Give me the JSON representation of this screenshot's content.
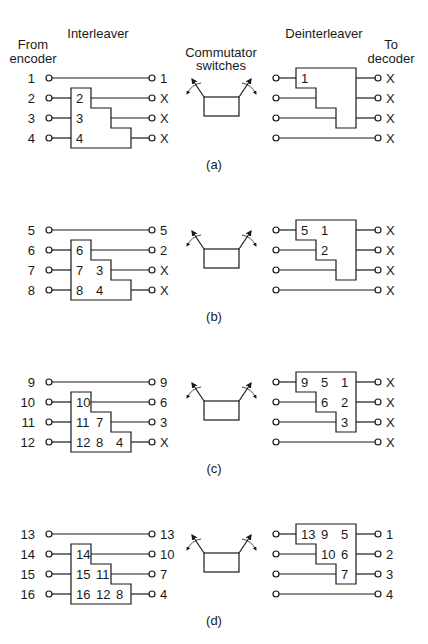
{
  "headers": {
    "from_encoder_line1": "From",
    "from_encoder_line2": "encoder",
    "interleaver": "Interleaver",
    "commutator_line1": "Commutator",
    "commutator_line2": "switches",
    "deinterleaver": "Deinterleaver",
    "to_decoder_line1": "To",
    "to_decoder_line2": "decoder"
  },
  "colors": {
    "line": "#1a1a1a",
    "background": "#ffffff"
  },
  "panels": [
    {
      "label": "(a)",
      "inputs": [
        "1",
        "2",
        "3",
        "4"
      ],
      "interleaver_cells": [
        [],
        [
          "2"
        ],
        [
          "3"
        ],
        [
          "4"
        ]
      ],
      "interleaver_outputs": [
        "1",
        "X",
        "X",
        "X"
      ],
      "deinterleaver_cells": [
        [
          "1"
        ],
        [],
        [],
        []
      ],
      "decoder_outputs": [
        "X",
        "X",
        "X",
        "X"
      ]
    },
    {
      "label": "(b)",
      "inputs": [
        "5",
        "6",
        "7",
        "8"
      ],
      "interleaver_cells": [
        [],
        [
          "6"
        ],
        [
          "7",
          "3"
        ],
        [
          "8",
          "4"
        ]
      ],
      "interleaver_outputs": [
        "5",
        "2",
        "X",
        "X"
      ],
      "deinterleaver_cells": [
        [
          "5",
          "1"
        ],
        [
          "2"
        ],
        [],
        []
      ],
      "decoder_outputs": [
        "X",
        "X",
        "X",
        "X"
      ]
    },
    {
      "label": "(c)",
      "inputs": [
        "9",
        "10",
        "11",
        "12"
      ],
      "interleaver_cells": [
        [],
        [
          "10"
        ],
        [
          "11",
          "7"
        ],
        [
          "12",
          "8",
          "4"
        ]
      ],
      "interleaver_outputs": [
        "9",
        "6",
        "3",
        "X"
      ],
      "deinterleaver_cells": [
        [
          "9",
          "5",
          "1"
        ],
        [
          "6",
          "2"
        ],
        [
          "3"
        ],
        []
      ],
      "decoder_outputs": [
        "X",
        "X",
        "X",
        "X"
      ]
    },
    {
      "label": "(d)",
      "inputs": [
        "13",
        "14",
        "15",
        "16"
      ],
      "interleaver_cells": [
        [],
        [
          "14"
        ],
        [
          "15",
          "11"
        ],
        [
          "16",
          "12",
          "8"
        ]
      ],
      "interleaver_outputs": [
        "13",
        "10",
        "7",
        "4"
      ],
      "deinterleaver_cells": [
        [
          "13",
          "9",
          "5"
        ],
        [
          "10",
          "6"
        ],
        [
          "7"
        ],
        []
      ],
      "decoder_outputs": [
        "1",
        "2",
        "3",
        "4"
      ]
    }
  ]
}
